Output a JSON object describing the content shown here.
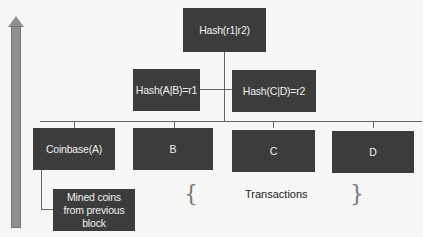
{
  "diagram": {
    "root": {
      "label": "Hash(r1|r2)"
    },
    "level1": [
      {
        "label": "Hash(A|B)=r1"
      },
      {
        "label": "Hash(C|D)=r2"
      }
    ],
    "leaves": [
      {
        "label": "Coinbase(A)"
      },
      {
        "label": "B"
      },
      {
        "label": "C"
      },
      {
        "label": "D"
      }
    ],
    "mined_coins": {
      "label": "Mined coins from previous block"
    },
    "transactions_label": "Transactions",
    "brace_left": "{",
    "brace_right": "}",
    "colors": {
      "box": "#3c3c3c",
      "box_text": "#f0f0f0",
      "arrow": "#8f8f8f",
      "line": "#666666"
    }
  }
}
